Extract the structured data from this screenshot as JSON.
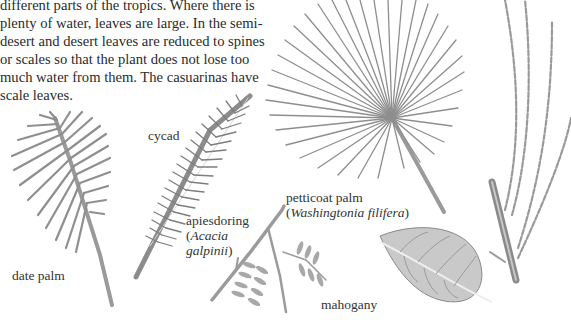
{
  "paragraph": {
    "lines": [
      "different parts of the tropics. Where there is",
      "plenty of water, leaves are large. In the semi-",
      "desert and desert leaves are reduced to spines",
      "or scales so that the plant does not lose too",
      "much water from them. The casuarinas have",
      "scale leaves."
    ]
  },
  "illustrations": [
    {
      "id": "date-palm",
      "label": "date palm"
    },
    {
      "id": "cycad",
      "label": "cycad"
    },
    {
      "id": "apiesdoring",
      "label": "apiesdoring",
      "scientific_name": "Acacia galpinii"
    },
    {
      "id": "petticoat-palm",
      "label": "petticoat palm",
      "scientific_name": "Washingtonia filifera"
    },
    {
      "id": "mahogany",
      "label": "mahogany"
    },
    {
      "id": "casuarina",
      "label": ""
    }
  ],
  "labels": {
    "date_palm": "date palm",
    "cycad": "cycad",
    "apiesdoring": "apiesdoring",
    "acacia_open": "(",
    "acacia_genus": "Acacia",
    "acacia_species": "galpinii",
    "acacia_close": ")",
    "petticoat": "petticoat palm",
    "wash_open": "(",
    "wash_name": "Washingtonia filifera",
    "wash_close": ")",
    "mahogany": "mahogany"
  },
  "colors": {
    "text": "#2b2b2b",
    "ink": "#8a8a8a",
    "ink_dark": "#6e6e6e",
    "background": "#ffffff"
  }
}
